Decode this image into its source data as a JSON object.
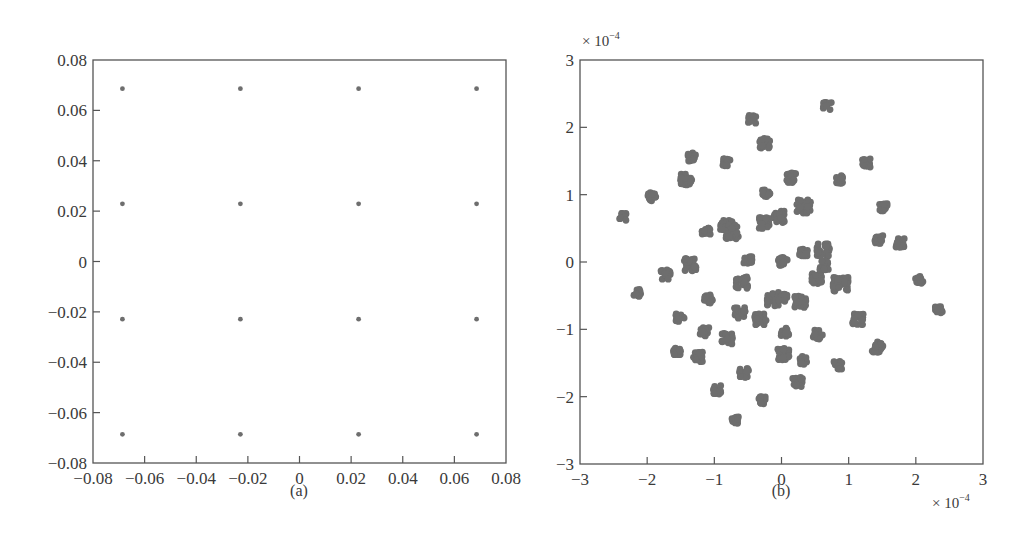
{
  "figure": {
    "panel_a_caption": "(a)",
    "panel_b_caption": "(b)",
    "panel_b_y_multiplier": "× 10",
    "panel_b_y_multiplier_exp": "−4",
    "panel_b_x_multiplier": "× 10",
    "panel_b_x_multiplier_exp": "−4",
    "point_color": "#6e6e6e"
  },
  "chart_data": [
    {
      "type": "scatter",
      "title": "(a)",
      "xlabel": "",
      "ylabel": "",
      "xlim": [
        -0.08,
        0.08
      ],
      "ylim": [
        -0.08,
        0.08
      ],
      "grid": false,
      "xticks": [
        -0.08,
        -0.06,
        -0.04,
        -0.02,
        0,
        0.02,
        0.04,
        0.06,
        0.08
      ],
      "xtick_labels": [
        "−0.08",
        "−0.06",
        "−0.04",
        "−0.02",
        "0",
        "0.02",
        "0.04",
        "0.06",
        "0.08"
      ],
      "yticks": [
        0.08,
        0.06,
        0.04,
        0.02,
        0,
        -0.02,
        -0.04,
        -0.06,
        -0.08
      ],
      "ytick_labels": [
        "0.08",
        "0.06",
        "0.04",
        "0.02",
        "0",
        "−0.02",
        "−0.04",
        "−0.06",
        "−0.08"
      ],
      "series": [
        {
          "name": "16-point constellation",
          "points": [
            [
              -0.0686,
              0.0686
            ],
            [
              -0.0229,
              0.0686
            ],
            [
              0.0229,
              0.0686
            ],
            [
              0.0686,
              0.0686
            ],
            [
              -0.0686,
              0.0229
            ],
            [
              -0.0229,
              0.0229
            ],
            [
              0.0229,
              0.0229
            ],
            [
              0.0686,
              0.0229
            ],
            [
              -0.0686,
              -0.0229
            ],
            [
              -0.0229,
              -0.0229
            ],
            [
              0.0229,
              -0.0229
            ],
            [
              0.0686,
              -0.0229
            ],
            [
              -0.0686,
              -0.0686
            ],
            [
              -0.0229,
              -0.0686
            ],
            [
              0.0229,
              -0.0686
            ],
            [
              0.0686,
              -0.0686
            ]
          ]
        }
      ]
    },
    {
      "type": "scatter",
      "title": "(b)",
      "xlabel": "× 10^-4",
      "ylabel": "× 10^-4",
      "xlim": [
        -3,
        3
      ],
      "ylim": [
        -3,
        3
      ],
      "grid": false,
      "xticks": [
        -3,
        -2,
        -1,
        0,
        1,
        2,
        3
      ],
      "xtick_labels": [
        "−3",
        "−2",
        "−1",
        "0",
        "1",
        "2",
        "3"
      ],
      "yticks": [
        3,
        2,
        1,
        0,
        -1,
        -2,
        -3
      ],
      "ytick_labels": [
        "3",
        "2",
        "1",
        "0",
        "−1",
        "−2",
        "−3"
      ],
      "series": [
        {
          "name": "received symbol clusters (× 10^-4)",
          "clusters": [
            [
              -0.44,
              2.12,
              1.0
            ],
            [
              -0.25,
              1.77,
              1.3
            ],
            [
              -1.33,
              1.56,
              1.0
            ],
            [
              -0.81,
              1.47,
              1.0
            ],
            [
              -1.42,
              1.23,
              1.4
            ],
            [
              -1.93,
              0.97,
              1.0
            ],
            [
              -2.36,
              0.67,
              0.9
            ],
            [
              -0.23,
              1.03,
              1.0
            ],
            [
              -0.77,
              0.48,
              2.2
            ],
            [
              -1.12,
              0.45,
              1.0
            ],
            [
              -0.25,
              0.58,
              1.3
            ],
            [
              -0.04,
              0.67,
              1.4
            ],
            [
              0.68,
              2.32,
              1.0
            ],
            [
              1.26,
              1.47,
              1.0
            ],
            [
              0.87,
              1.22,
              1.0
            ],
            [
              0.14,
              1.25,
              1.2
            ],
            [
              0.33,
              0.82,
              1.7
            ],
            [
              1.52,
              0.82,
              1.0
            ],
            [
              1.45,
              0.33,
              1.0
            ],
            [
              1.76,
              0.28,
              1.1
            ],
            [
              0.62,
              0.18,
              1.5
            ],
            [
              0.33,
              0.13,
              1.0
            ],
            [
              -0.5,
              0.03,
              1.0
            ],
            [
              0.02,
              0.0,
              1.1
            ],
            [
              -1.73,
              -0.19,
              1.2
            ],
            [
              -2.15,
              -0.46,
              0.9
            ],
            [
              -1.09,
              -0.55,
              1.0
            ],
            [
              -1.51,
              -0.83,
              1.0
            ],
            [
              -0.59,
              -0.31,
              1.4
            ],
            [
              -0.62,
              -0.76,
              1.3
            ],
            [
              -0.32,
              -0.84,
              1.5
            ],
            [
              -0.14,
              -0.56,
              1.5
            ],
            [
              -1.15,
              -1.04,
              1.1
            ],
            [
              -0.81,
              -1.14,
              1.3
            ],
            [
              -1.55,
              -1.34,
              1.0
            ],
            [
              -1.24,
              -1.41,
              1.2
            ],
            [
              -0.56,
              -1.65,
              1.1
            ],
            [
              -0.96,
              -1.9,
              1.0
            ],
            [
              -0.28,
              -2.05,
              0.9
            ],
            [
              -0.69,
              -2.35,
              0.9
            ],
            [
              -1.36,
              -0.04,
              1.5
            ],
            [
              0.54,
              -0.24,
              1.4
            ],
            [
              0.88,
              -0.34,
              1.8
            ],
            [
              2.05,
              -0.27,
              0.9
            ],
            [
              2.34,
              -0.7,
              0.9
            ],
            [
              0.28,
              -0.59,
              1.4
            ],
            [
              1.14,
              -0.85,
              1.3
            ],
            [
              0.54,
              -1.08,
              1.1
            ],
            [
              1.43,
              -1.26,
              1.3
            ],
            [
              0.05,
              -1.04,
              1.0
            ],
            [
              0.33,
              -1.46,
              1.0
            ],
            [
              0.84,
              -1.53,
              1.0
            ],
            [
              0.03,
              -1.37,
              1.4
            ],
            [
              0.24,
              -1.78,
              1.2
            ],
            [
              0.63,
              -0.05,
              1.2
            ],
            [
              0.02,
              -0.52,
              1.2
            ]
          ]
        }
      ]
    }
  ]
}
